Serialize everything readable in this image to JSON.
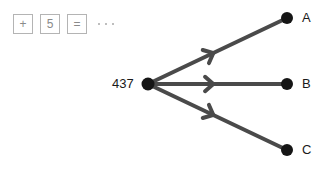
{
  "palette": {
    "tokens": [
      {
        "glyph": "+",
        "name": "plus"
      },
      {
        "glyph": "5",
        "name": "five"
      },
      {
        "glyph": "=",
        "name": "equals"
      }
    ],
    "ellipsis_dots": 3
  },
  "diagram": {
    "type": "directed-graph",
    "stroke_color": "#4a4a4a",
    "node_color": "#151515",
    "root": {
      "label": "437",
      "x": 148,
      "y": 84
    },
    "targets": [
      {
        "label": "A",
        "x": 287,
        "y": 18
      },
      {
        "label": "B",
        "x": 287,
        "y": 84
      },
      {
        "label": "C",
        "x": 287,
        "y": 150
      }
    ],
    "edges": [
      {
        "from": "437",
        "to": "A",
        "arrow": "chevron"
      },
      {
        "from": "437",
        "to": "B",
        "arrow": "chevron"
      },
      {
        "from": "437",
        "to": "C",
        "arrow": "chevron"
      }
    ]
  }
}
